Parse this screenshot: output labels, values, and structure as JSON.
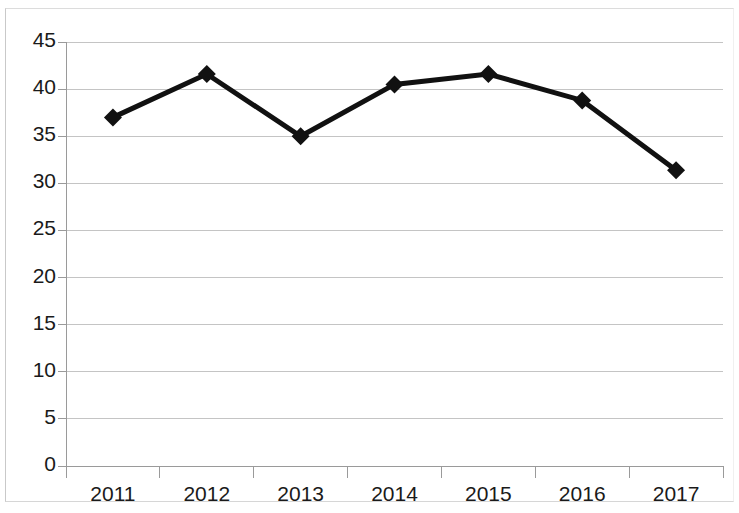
{
  "chart_data": {
    "type": "line",
    "title": "",
    "subtitle": "",
    "xlabel": "",
    "ylabel": "",
    "categories": [
      "2011",
      "2012",
      "2013",
      "2014",
      "2015",
      "2016",
      "2017"
    ],
    "values": [
      37.0,
      41.6,
      35.0,
      40.5,
      41.6,
      38.8,
      31.4
    ],
    "series": [
      {
        "name": "",
        "values": [
          37.0,
          41.6,
          35.0,
          40.5,
          41.6,
          38.8,
          31.4
        ]
      }
    ],
    "ylim": [
      0,
      45
    ],
    "ytick_labels": [
      "0",
      "5",
      "10",
      "15",
      "20",
      "25",
      "30",
      "35",
      "40",
      "45"
    ],
    "ytick_values": [
      0,
      5,
      10,
      15,
      20,
      25,
      30,
      35,
      40,
      45
    ],
    "xtick_labels": [
      "2011",
      "2012",
      "2013",
      "2014",
      "2015",
      "2016",
      "2017"
    ],
    "grid": "horizontal",
    "legend": "none",
    "annotations": [],
    "colors": {
      "line": "#111111",
      "marker": "#111111",
      "grid": "#c4c4c4",
      "axis": "#9a9a9a",
      "background": "#ffffff",
      "tick_text": "#1a1a1a"
    },
    "marker_shape": "diamond",
    "line_width": 5
  }
}
